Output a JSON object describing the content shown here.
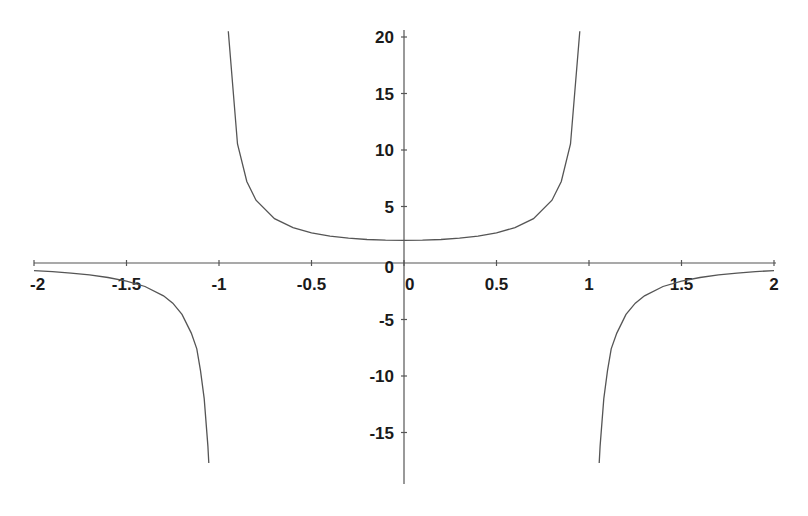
{
  "chart_data": {
    "type": "line",
    "title": "",
    "xlabel": "",
    "ylabel": "",
    "function": "y = 2 / (1 - x^2)",
    "xlim": [
      -2,
      2
    ],
    "ylim": [
      -19,
      20.5
    ],
    "grid": false,
    "legend": null,
    "x_ticks": [
      -2,
      -1.5,
      -1,
      -0.5,
      0,
      0.5,
      1,
      1.5,
      2
    ],
    "x_tick_labels": [
      "-2",
      "-1.5",
      "-1",
      "-0.5",
      "0",
      "0.5",
      "1",
      "1.5",
      "2"
    ],
    "y_ticks": [
      20,
      15,
      10,
      5,
      0,
      -5,
      -10,
      -15
    ],
    "y_tick_labels": [
      "20",
      "15",
      "10",
      "5",
      "0",
      "-5",
      "-10",
      "-15"
    ],
    "vertical_asymptotes": [
      -1,
      1
    ],
    "series": [
      {
        "name": "left-branch",
        "x": [
          -2.0,
          -1.9,
          -1.8,
          -1.7,
          -1.6,
          -1.5,
          -1.4,
          -1.3,
          -1.25,
          -1.2,
          -1.15,
          -1.12,
          -1.1,
          -1.08,
          -1.06,
          -1.055
        ],
        "y": [
          -0.67,
          -0.76,
          -0.89,
          -1.05,
          -1.28,
          -1.6,
          -2.08,
          -2.9,
          -3.56,
          -4.55,
          -6.2,
          -7.6,
          -9.52,
          -12.0,
          -16.2,
          -17.7
        ]
      },
      {
        "name": "middle-branch",
        "x": [
          -0.95,
          -0.9,
          -0.85,
          -0.8,
          -0.7,
          -0.6,
          -0.5,
          -0.4,
          -0.3,
          -0.2,
          -0.1,
          0.0,
          0.1,
          0.2,
          0.3,
          0.4,
          0.5,
          0.6,
          0.7,
          0.8,
          0.85,
          0.9,
          0.95
        ],
        "y": [
          20.5,
          10.53,
          7.21,
          5.56,
          3.92,
          3.13,
          2.67,
          2.38,
          2.2,
          2.08,
          2.02,
          2.0,
          2.02,
          2.08,
          2.2,
          2.38,
          2.67,
          3.13,
          3.92,
          5.56,
          7.21,
          10.53,
          20.5
        ]
      },
      {
        "name": "right-branch",
        "x": [
          1.055,
          1.06,
          1.08,
          1.1,
          1.12,
          1.15,
          1.2,
          1.25,
          1.3,
          1.4,
          1.5,
          1.6,
          1.7,
          1.8,
          1.9,
          2.0
        ],
        "y": [
          -17.7,
          -16.2,
          -12.0,
          -9.52,
          -7.6,
          -6.2,
          -4.55,
          -3.56,
          -2.9,
          -2.08,
          -1.6,
          -1.28,
          -1.05,
          -0.89,
          -0.76,
          -0.67
        ]
      }
    ]
  },
  "style": {
    "line_color": "#555555",
    "text_color": "#1a1a1a",
    "background": "#ffffff"
  }
}
